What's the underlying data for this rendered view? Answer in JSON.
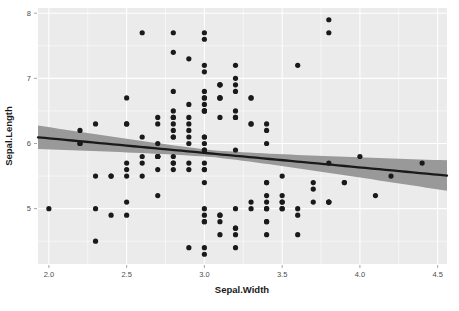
{
  "chart_data": {
    "type": "scatter",
    "title": "",
    "subtitle": "",
    "xlabel": "Sepal.Width",
    "ylabel": "Sepal.Length",
    "xlim": [
      1.93,
      4.56
    ],
    "ylim": [
      4.15,
      8.08
    ],
    "xticks": [
      2.0,
      2.5,
      3.0,
      3.5,
      4.0,
      4.5
    ],
    "xtick_labels": [
      "2.0",
      "2.5",
      "3.0",
      "3.5",
      "4.0",
      "4.5"
    ],
    "yticks": [
      5,
      6,
      7,
      8
    ],
    "ytick_labels": [
      "5",
      "6",
      "7",
      "8"
    ],
    "xminor": [
      2.25,
      2.75,
      3.25,
      3.75,
      4.25
    ],
    "yminor": [
      4.5,
      5.5,
      6.5,
      7.5
    ],
    "grid": true,
    "legend": null,
    "panel_background": "#ebebeb",
    "grid_color": "#ffffff",
    "point_color": "#1a1a1a",
    "point_size": 2.6,
    "line_color": "#1a1a1a",
    "band_color": "#999999",
    "smooth": {
      "method": "lm",
      "intercept": 6.5262,
      "slope": -0.2234,
      "se_at_xmin": 0.175,
      "se_at_xmean": 0.0525,
      "se_at_xmax": 0.215,
      "x_mean": 3.057,
      "line_x": [
        1.93,
        4.56
      ],
      "line_y": [
        6.095,
        5.508
      ],
      "band_upper_x": [
        1.93,
        4.56
      ],
      "band_upper_y": [
        6.29,
        5.75
      ],
      "band_lower_x": [
        1.93,
        4.56
      ],
      "band_lower_y": [
        5.9,
        5.27
      ]
    },
    "x": [
      3.5,
      3.0,
      3.2,
      3.1,
      3.6,
      3.9,
      3.4,
      3.4,
      2.9,
      3.1,
      3.7,
      3.4,
      3.0,
      3.0,
      4.0,
      4.4,
      3.9,
      3.5,
      3.8,
      3.8,
      3.4,
      3.7,
      3.6,
      3.3,
      3.4,
      3.0,
      3.4,
      3.5,
      3.4,
      3.2,
      3.1,
      3.4,
      4.1,
      4.2,
      3.1,
      3.2,
      3.5,
      3.6,
      3.0,
      3.4,
      3.5,
      2.3,
      3.2,
      3.5,
      3.8,
      3.0,
      3.8,
      3.2,
      3.7,
      3.3,
      3.2,
      3.2,
      3.1,
      2.3,
      2.8,
      2.8,
      3.3,
      2.4,
      2.9,
      2.7,
      2.0,
      3.0,
      2.2,
      2.9,
      2.9,
      3.1,
      3.0,
      2.7,
      2.2,
      2.5,
      3.2,
      2.8,
      2.5,
      2.8,
      2.9,
      3.0,
      2.8,
      3.0,
      2.9,
      2.6,
      2.4,
      2.4,
      2.7,
      2.7,
      3.0,
      3.4,
      3.1,
      2.3,
      3.0,
      2.5,
      2.6,
      3.0,
      2.6,
      2.3,
      2.7,
      3.0,
      2.9,
      2.9,
      2.5,
      2.8,
      3.3,
      2.7,
      3.0,
      2.9,
      3.0,
      3.0,
      2.5,
      2.9,
      2.5,
      3.6,
      3.2,
      2.7,
      3.0,
      2.5,
      2.8,
      3.2,
      3.0,
      3.8,
      2.6,
      2.2,
      3.2,
      2.8,
      2.8,
      2.7,
      3.3,
      3.2,
      2.8,
      3.0,
      2.8,
      3.0,
      2.8,
      3.8,
      2.8,
      2.8,
      2.6,
      3.0,
      3.4,
      3.1,
      3.0,
      3.1,
      3.1,
      3.1,
      2.7,
      3.2,
      3.3,
      3.0,
      2.5,
      3.0,
      3.4,
      3.0
    ],
    "y": [
      5.1,
      4.9,
      4.7,
      4.6,
      5.0,
      5.4,
      4.6,
      5.0,
      4.4,
      4.9,
      5.4,
      4.8,
      4.8,
      4.3,
      5.8,
      5.7,
      5.4,
      5.1,
      5.7,
      5.1,
      5.4,
      5.1,
      4.6,
      5.1,
      4.8,
      5.0,
      5.0,
      5.2,
      5.2,
      4.7,
      4.8,
      5.4,
      5.2,
      5.5,
      4.9,
      5.0,
      5.5,
      4.9,
      4.4,
      5.1,
      5.0,
      4.5,
      4.4,
      5.0,
      5.1,
      4.8,
      5.1,
      4.6,
      5.3,
      5.0,
      7.0,
      6.4,
      6.9,
      5.5,
      6.5,
      5.7,
      6.3,
      4.9,
      6.6,
      5.2,
      5.0,
      5.9,
      6.0,
      6.1,
      5.6,
      6.7,
      5.6,
      5.8,
      6.2,
      5.6,
      5.9,
      6.1,
      6.3,
      6.1,
      6.4,
      6.6,
      6.8,
      6.7,
      6.0,
      5.7,
      5.5,
      5.5,
      5.8,
      6.0,
      5.4,
      6.0,
      6.7,
      6.3,
      5.6,
      5.5,
      5.5,
      6.1,
      5.8,
      5.0,
      5.6,
      5.7,
      5.7,
      6.2,
      5.1,
      5.7,
      6.3,
      5.8,
      7.1,
      6.3,
      6.5,
      7.6,
      4.9,
      7.3,
      6.7,
      7.2,
      6.5,
      6.4,
      6.8,
      5.7,
      5.8,
      6.4,
      6.5,
      7.7,
      7.7,
      6.0,
      6.9,
      5.6,
      7.7,
      6.3,
      6.7,
      7.2,
      6.2,
      6.1,
      6.4,
      7.2,
      7.4,
      7.9,
      6.4,
      6.3,
      6.1,
      7.7,
      6.3,
      6.4,
      6.0,
      6.9,
      6.7,
      6.9,
      5.8,
      6.8,
      6.7,
      6.7,
      6.3,
      6.5,
      6.2,
      5.9
    ]
  },
  "figure": {
    "axis_title_x": "Sepal.Width",
    "axis_title_y": "Sepal.Length"
  }
}
